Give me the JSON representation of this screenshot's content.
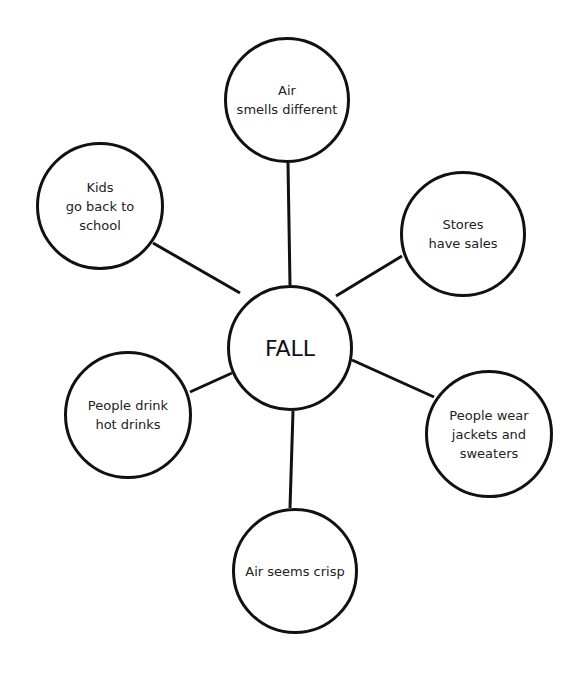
{
  "diagram": {
    "type": "web",
    "center": {
      "label": "FALL",
      "cx": 290,
      "cy": 348,
      "r": 63
    },
    "nodes": [
      {
        "id": "air-smells",
        "label": "Air\nsmells different",
        "cx": 287,
        "cy": 100,
        "r": 63
      },
      {
        "id": "kids-school",
        "label": "Kids\ngo back to\nschool",
        "cx": 100,
        "cy": 206,
        "r": 64
      },
      {
        "id": "stores-sales",
        "label": "Stores\nhave sales",
        "cx": 463,
        "cy": 234,
        "r": 63
      },
      {
        "id": "hot-drinks",
        "label": "People drink\nhot drinks",
        "cx": 128,
        "cy": 415,
        "r": 64
      },
      {
        "id": "jackets",
        "label": "People wear\njackets and\nsweaters",
        "cx": 489,
        "cy": 434,
        "r": 64
      },
      {
        "id": "air-crisp",
        "label": "Air seems crisp",
        "cx": 295,
        "cy": 571,
        "r": 63
      }
    ],
    "edge_color": "#111111"
  }
}
